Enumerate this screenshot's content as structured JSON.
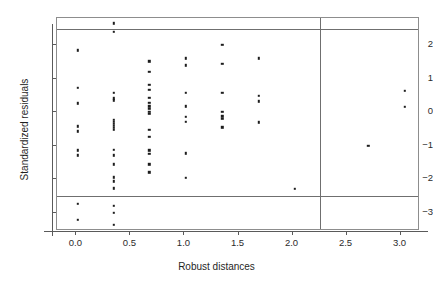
{
  "chart_data": {
    "type": "scatter",
    "title": "",
    "xlabel": "Robust distances",
    "ylabel": "Standardized residuals",
    "xlim": [
      -0.18,
      3.18
    ],
    "ylim": [
      -3.55,
      2.82
    ],
    "grid": false,
    "legend": null,
    "xticks": [
      0.0,
      0.5,
      1.0,
      1.5,
      2.0,
      2.5,
      3.0
    ],
    "xticklabels": [
      "0.0",
      "0.5",
      "1.0",
      "1.5",
      "2.0",
      "2.5",
      "3.0"
    ],
    "yticks": [
      2,
      1,
      0,
      -1,
      -2,
      -3
    ],
    "yticklabels": [
      "2",
      "1",
      "0",
      "-1",
      "-2",
      "-3"
    ],
    "reference_lines": {
      "horizontal": [
        2.5,
        -2.5
      ],
      "vertical": [
        2.25
      ],
      "color": "#6f6f6f"
    },
    "marker": {
      "shape": "square",
      "size": 2.4,
      "color": "#1d1d1d"
    },
    "points": [
      {
        "x": 0.01,
        "y": 1.85
      },
      {
        "x": 0.01,
        "y": 0.74
      },
      {
        "x": 0.01,
        "y": 0.27
      },
      {
        "x": 0.01,
        "y": -0.42
      },
      {
        "x": 0.01,
        "y": -0.57
      },
      {
        "x": 0.01,
        "y": -1.14
      },
      {
        "x": 0.01,
        "y": -1.29
      },
      {
        "x": 0.01,
        "y": -2.74
      },
      {
        "x": 0.01,
        "y": -3.22
      },
      {
        "x": 0.345,
        "y": 2.66
      },
      {
        "x": 0.345,
        "y": 2.4
      },
      {
        "x": 0.345,
        "y": 0.59
      },
      {
        "x": 0.345,
        "y": 0.42
      },
      {
        "x": 0.345,
        "y": 0.36
      },
      {
        "x": 0.345,
        "y": -0.22
      },
      {
        "x": 0.345,
        "y": -0.29
      },
      {
        "x": 0.345,
        "y": -0.35
      },
      {
        "x": 0.345,
        "y": -0.41
      },
      {
        "x": 0.345,
        "y": -0.47
      },
      {
        "x": 0.345,
        "y": -0.53
      },
      {
        "x": 0.345,
        "y": -1.13
      },
      {
        "x": 0.345,
        "y": -1.29
      },
      {
        "x": 0.345,
        "y": -1.55
      },
      {
        "x": 0.345,
        "y": -1.95
      },
      {
        "x": 0.345,
        "y": -2.06
      },
      {
        "x": 0.345,
        "y": -2.27
      },
      {
        "x": 0.345,
        "y": -2.79
      },
      {
        "x": 0.345,
        "y": -3.0
      },
      {
        "x": 0.345,
        "y": -3.37
      },
      {
        "x": 0.675,
        "y": 1.53
      },
      {
        "x": 0.675,
        "y": 1.22
      },
      {
        "x": 0.675,
        "y": 0.83
      },
      {
        "x": 0.675,
        "y": 0.67
      },
      {
        "x": 0.675,
        "y": 0.44
      },
      {
        "x": 0.675,
        "y": 0.28
      },
      {
        "x": 0.675,
        "y": 0.18
      },
      {
        "x": 0.675,
        "y": 0.1
      },
      {
        "x": 0.675,
        "y": 0.02
      },
      {
        "x": 0.675,
        "y": -0.05
      },
      {
        "x": 0.675,
        "y": -0.52
      },
      {
        "x": 0.675,
        "y": -0.74
      },
      {
        "x": 0.675,
        "y": -1.14
      },
      {
        "x": 0.675,
        "y": -1.24
      },
      {
        "x": 0.675,
        "y": -1.55
      },
      {
        "x": 0.675,
        "y": -1.79
      },
      {
        "x": 1.01,
        "y": 1.61
      },
      {
        "x": 1.01,
        "y": 1.4
      },
      {
        "x": 1.01,
        "y": 0.58
      },
      {
        "x": 1.01,
        "y": 0.18
      },
      {
        "x": 1.01,
        "y": -0.13
      },
      {
        "x": 1.01,
        "y": -0.28
      },
      {
        "x": 1.01,
        "y": -1.23
      },
      {
        "x": 1.01,
        "y": -1.96
      },
      {
        "x": 1.35,
        "y": 2.02
      },
      {
        "x": 1.35,
        "y": 1.45
      },
      {
        "x": 1.35,
        "y": 0.58
      },
      {
        "x": 1.35,
        "y": 0.02
      },
      {
        "x": 1.35,
        "y": -0.12
      },
      {
        "x": 1.35,
        "y": -0.2
      },
      {
        "x": 1.35,
        "y": -0.45
      },
      {
        "x": 1.69,
        "y": 1.61
      },
      {
        "x": 1.69,
        "y": 0.49
      },
      {
        "x": 1.69,
        "y": 0.33
      },
      {
        "x": 1.69,
        "y": -0.3
      },
      {
        "x": 2.02,
        "y": -2.28
      },
      {
        "x": 2.7,
        "y": -1.0
      },
      {
        "x": 3.04,
        "y": 0.65
      },
      {
        "x": 3.04,
        "y": 0.17
      }
    ]
  }
}
